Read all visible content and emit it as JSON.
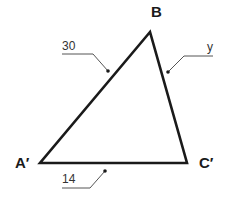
{
  "diagram": {
    "type": "triangle",
    "vertices": [
      {
        "id": "B",
        "label": "B",
        "x": 150,
        "y": 32
      },
      {
        "id": "A_prime",
        "label": "A′",
        "x": 40,
        "y": 163
      },
      {
        "id": "C_prime",
        "label": "C′",
        "x": 187,
        "y": 163
      }
    ],
    "sides": [
      {
        "id": "A_prime_B",
        "from": "A′",
        "to": "B",
        "label": "30"
      },
      {
        "id": "B_C_prime",
        "from": "B",
        "to": "C′",
        "label": "y"
      },
      {
        "id": "A_prime_C_prime",
        "from": "A′",
        "to": "C′",
        "label": "14"
      }
    ],
    "colors": {
      "edge": "#1a1a1a",
      "leader": "#555555",
      "background": "#ffffff"
    }
  }
}
